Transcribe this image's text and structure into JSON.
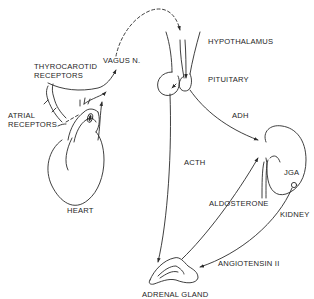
{
  "diagram": {
    "type": "physiological-pathway",
    "background": "#ffffff",
    "line_color": "#2a2a2a",
    "labels": {
      "vagus": "VAGUS N.",
      "thyrocarotid_1": "THYROCAROTID",
      "thyrocarotid_2": "RECEPTORS",
      "atrial_1": "ATRIAL",
      "atrial_2": "RECEPTORS",
      "heart": "HEART",
      "hypothalamus": "HYPOTHALAMUS",
      "pituitary": "PITUITARY",
      "adh": "ADH",
      "acth": "ACTH",
      "jga": "JGA",
      "aldosterone": "ALDOSTERONE",
      "kidney": "KIDNEY",
      "angiotensin": "ANGIOTENSIN II",
      "adrenal": "ADRENAL GLAND"
    },
    "nodes": [
      {
        "id": "heart",
        "label": "HEART"
      },
      {
        "id": "thyrocarotid_receptors",
        "label": "THYROCAROTID RECEPTORS"
      },
      {
        "id": "atrial_receptors",
        "label": "ATRIAL RECEPTORS"
      },
      {
        "id": "vagus",
        "label": "VAGUS N."
      },
      {
        "id": "hypothalamus",
        "label": "HYPOTHALAMUS"
      },
      {
        "id": "pituitary",
        "label": "PITUITARY"
      },
      {
        "id": "kidney",
        "label": "KIDNEY"
      },
      {
        "id": "jga",
        "label": "JGA"
      },
      {
        "id": "adrenal",
        "label": "ADRENAL GLAND"
      }
    ],
    "edges": [
      {
        "from": "thyrocarotid_receptors",
        "to": "vagus",
        "style": "solid"
      },
      {
        "from": "atrial_receptors",
        "to": "vagus",
        "style": "solid"
      },
      {
        "from": "vagus",
        "to": "hypothalamus",
        "style": "dashed"
      },
      {
        "from": "hypothalamus",
        "to": "pituitary",
        "style": "solid"
      },
      {
        "from": "pituitary",
        "to": "kidney",
        "label": "ADH",
        "style": "solid"
      },
      {
        "from": "pituitary",
        "to": "adrenal",
        "label": "ACTH",
        "style": "solid"
      },
      {
        "from": "adrenal",
        "to": "kidney",
        "label": "ALDOSTERONE",
        "style": "solid"
      },
      {
        "from": "jga",
        "to": "adrenal",
        "label": "ANGIOTENSIN II",
        "style": "solid"
      }
    ]
  }
}
